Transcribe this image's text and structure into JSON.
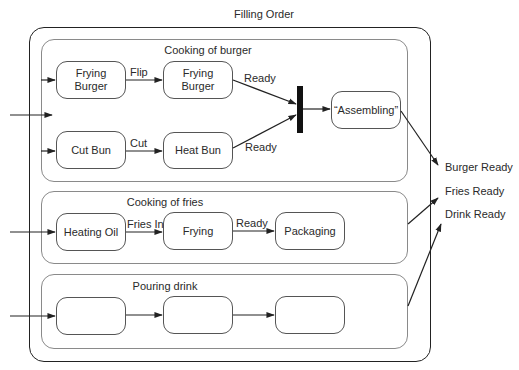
{
  "diagram": {
    "title": "Filling Order",
    "regions": [
      {
        "name": "Cooking of burger",
        "nodes": [
          "Frying Burger",
          "Frying Burger",
          "Cut Bun",
          "Heat Bun",
          "“Assembling”"
        ],
        "transitions": [
          {
            "from": "Frying Burger",
            "to": "Frying Burger",
            "label": "Flip"
          },
          {
            "from": "Cut Bun",
            "to": "Heat Bun",
            "label": "Cut"
          },
          {
            "from": "Frying Burger",
            "to": "join-bar",
            "label": "Ready"
          },
          {
            "from": "Heat Bun",
            "to": "join-bar",
            "label": "Ready"
          },
          {
            "from": "join-bar",
            "to": "“Assembling”",
            "label": ""
          }
        ]
      },
      {
        "name": "Cooking of fries",
        "nodes": [
          "Heating Oil",
          "Frying",
          "Packaging"
        ],
        "transitions": [
          {
            "from": "Heating Oil",
            "to": "Frying",
            "label": "Fries In"
          },
          {
            "from": "Frying",
            "to": "Packaging",
            "label": "Ready"
          }
        ]
      },
      {
        "name": "Pouring drink",
        "nodes": [
          "",
          "",
          ""
        ],
        "transitions": [
          {
            "from": "node1",
            "to": "node2",
            "label": ""
          },
          {
            "from": "node2",
            "to": "node3",
            "label": ""
          }
        ]
      }
    ],
    "outputs": [
      "Burger Ready",
      "Fries Ready",
      "Drink Ready"
    ],
    "labels": {
      "flip": "Flip",
      "cut": "Cut",
      "ready_top": "Ready",
      "ready_bottom": "Ready",
      "fries_in": "Fries In",
      "fries_ready": "Ready"
    },
    "node_text": {
      "frying_burger_1_line1": "Frying",
      "frying_burger_1_line2": "Burger",
      "frying_burger_2_line1": "Frying",
      "frying_burger_2_line2": "Burger",
      "cut_bun": "Cut Bun",
      "heat_bun": "Heat Bun",
      "assembling": "“Assembling”",
      "heating_oil": "Heating Oil",
      "frying": "Frying",
      "packaging": "Packaging"
    },
    "colors": {
      "line": "#222222",
      "region_border": "#8a8a8a",
      "node_border": "#555555",
      "background": "#ffffff"
    }
  }
}
